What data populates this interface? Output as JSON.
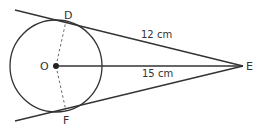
{
  "diagram": {
    "type": "geometry",
    "colors": {
      "stroke": "#333333",
      "background": "#ffffff"
    },
    "points": {
      "O": {
        "label": "O",
        "x": 56,
        "y": 66
      },
      "D": {
        "label": "D",
        "x": 66,
        "y": 21
      },
      "F": {
        "label": "F",
        "x": 66,
        "y": 111
      },
      "E": {
        "label": "E",
        "x": 243,
        "y": 66
      }
    },
    "circle": {
      "center": "O",
      "r": 46
    },
    "segments": [
      {
        "from": "D",
        "to": "E",
        "style": "solid",
        "label": "12cm"
      },
      {
        "from": "O",
        "to": "E",
        "style": "solid",
        "label": "15cm"
      },
      {
        "from": "F",
        "to": "E",
        "style": "solid"
      },
      {
        "from": "O",
        "to": "D",
        "style": "dashed"
      },
      {
        "from": "O",
        "to": "F",
        "style": "dashed"
      }
    ],
    "labels": {
      "O": "O",
      "D": "D",
      "F": "F",
      "E": "E",
      "DE_length": "12 cm",
      "OE_length": "15 cm"
    }
  }
}
